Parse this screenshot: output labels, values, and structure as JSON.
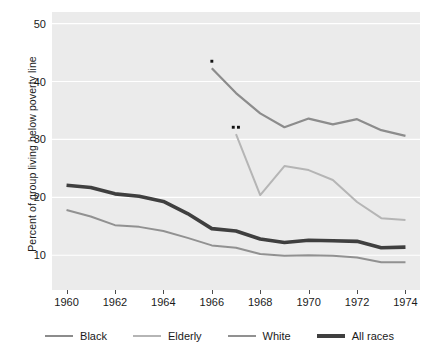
{
  "chart_data": {
    "type": "line",
    "title": "",
    "xlabel": "",
    "ylabel": "Percent of group living below poverty line",
    "xlim": [
      1959.4,
      1974.6
    ],
    "ylim": [
      4.0,
      52.0
    ],
    "xticks": [
      1960,
      1962,
      1964,
      1966,
      1968,
      1970,
      1972,
      1974
    ],
    "yticks": [
      10,
      20,
      30,
      40,
      50
    ],
    "grid": "horizontal-white",
    "legend_position": "bottom",
    "plot_background": "#ebebeb",
    "series": [
      {
        "name": "Black",
        "color": "#8c8c8c",
        "width": 2.2,
        "x": [
          1966,
          1967,
          1968,
          1969,
          1970,
          1971,
          1972,
          1973,
          1974
        ],
        "values": [
          42.3,
          38.0,
          34.5,
          32.1,
          33.6,
          32.6,
          33.5,
          31.6,
          30.6
        ]
      },
      {
        "name": "Elderly",
        "color": "#b5b5b5",
        "width": 2.0,
        "x": [
          1967,
          1968,
          1969,
          1970,
          1971,
          1972,
          1973,
          1974
        ],
        "values": [
          30.9,
          20.4,
          25.4,
          24.7,
          23.0,
          19.2,
          16.4,
          16.1
        ]
      },
      {
        "name": "White",
        "color": "#919191",
        "width": 2.0,
        "x": [
          1960,
          1961,
          1962,
          1963,
          1964,
          1965,
          1966,
          1967,
          1968,
          1969,
          1970,
          1971,
          1972,
          1973,
          1974
        ],
        "values": [
          17.8,
          16.7,
          15.2,
          14.9,
          14.2,
          13.0,
          11.7,
          11.3,
          10.2,
          9.9,
          10.0,
          9.9,
          9.6,
          8.8,
          8.8
        ]
      },
      {
        "name": "All races",
        "color": "#3f3f3f",
        "width": 3.6,
        "x": [
          1960,
          1961,
          1962,
          1963,
          1964,
          1965,
          1966,
          1967,
          1968,
          1969,
          1970,
          1971,
          1972,
          1973,
          1974
        ],
        "values": [
          22.1,
          21.7,
          20.6,
          20.2,
          19.3,
          17.2,
          14.6,
          14.2,
          12.8,
          12.2,
          12.6,
          12.5,
          12.4,
          11.3,
          11.4
        ]
      }
    ],
    "annotations": [
      {
        "text": "*",
        "x": 1966,
        "y": 42.3,
        "name": "single-asterisk-annotation"
      },
      {
        "text": "**",
        "x": 1967,
        "y": 30.9,
        "name": "double-asterisk-annotation"
      }
    ]
  },
  "axes": {
    "y_title": "Percent of group living below poverty line",
    "y_tick_labels": [
      "10",
      "20",
      "30",
      "40",
      "50"
    ],
    "x_tick_labels": [
      "1960",
      "1962",
      "1964",
      "1966",
      "1968",
      "1970",
      "1972",
      "1974"
    ]
  },
  "legend": {
    "items": [
      {
        "label": "Black",
        "color": "#8c8c8c",
        "thickness": 2.4
      },
      {
        "label": "Elderly",
        "color": "#b5b5b5",
        "thickness": 2.2
      },
      {
        "label": "White",
        "color": "#919191",
        "thickness": 2.2
      },
      {
        "label": "All races",
        "color": "#3f3f3f",
        "thickness": 4.2
      }
    ]
  }
}
